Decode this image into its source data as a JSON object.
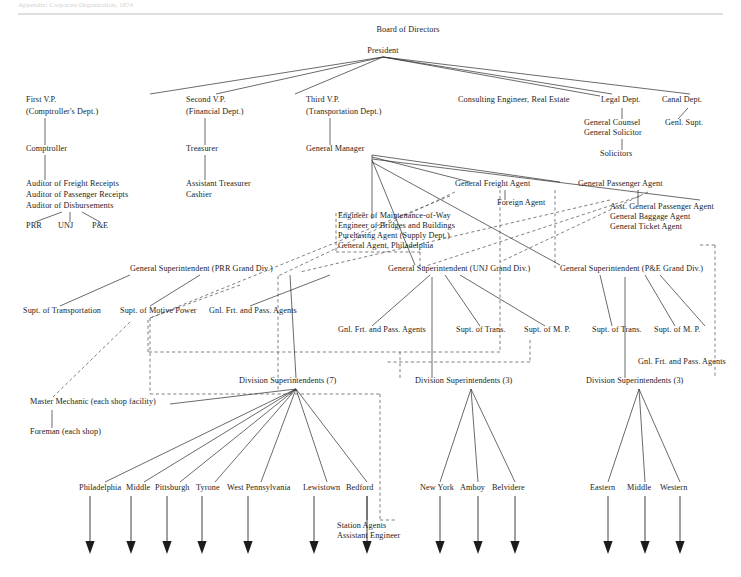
{
  "page": {
    "header_ghost": "Appendix: Corporate Organization, 1874",
    "background": "#ffffff",
    "ink": "#1c1c1c",
    "rule_color": "#b9b9b9"
  },
  "chart_data": {
    "type": "diagram",
    "subtype": "organization-tree",
    "legend": {
      "solid": "direct line of authority",
      "dashed": "staff / functional relationship"
    },
    "nodes": [
      {
        "id": "board",
        "label": "Board of Directors",
        "x": 408,
        "y": 32,
        "anchor": "middle",
        "size": "md"
      },
      {
        "id": "president",
        "label": "President",
        "x": 383,
        "y": 53,
        "anchor": "middle",
        "size": "md"
      },
      {
        "id": "vp1",
        "label": "First V.P.",
        "x": 26,
        "y": 102,
        "anchor": "start",
        "size": "md"
      },
      {
        "id": "vp1sub",
        "label": "(Comptroller's Dept.)",
        "x": 26,
        "y": 114,
        "anchor": "start",
        "size": "md"
      },
      {
        "id": "vp2",
        "label": "Second V.P.",
        "x": 186,
        "y": 102,
        "anchor": "start",
        "size": "md"
      },
      {
        "id": "vp2sub",
        "label": "(Financial Dept.)",
        "x": 186,
        "y": 114,
        "anchor": "start",
        "size": "md"
      },
      {
        "id": "vp3",
        "label": "Third V.P.",
        "x": 306,
        "y": 102,
        "anchor": "start",
        "size": "md"
      },
      {
        "id": "vp3sub",
        "label": "(Transportation Dept.)",
        "x": 306,
        "y": 114,
        "anchor": "start",
        "size": "md"
      },
      {
        "id": "consulting",
        "label": "Consulting Engineer, Real Estate",
        "x": 458,
        "y": 102,
        "anchor": "start",
        "size": "md"
      },
      {
        "id": "legal",
        "label": "Legal Dept.",
        "x": 601,
        "y": 102,
        "anchor": "start",
        "size": "md"
      },
      {
        "id": "canal",
        "label": "Canal Dept.",
        "x": 662,
        "y": 102,
        "anchor": "start",
        "size": "md"
      },
      {
        "id": "gencounsel",
        "label": "General  Counsel",
        "x": 584,
        "y": 125,
        "anchor": "start",
        "size": "md"
      },
      {
        "id": "gensolicitor",
        "label": "General  Solicitor",
        "x": 584,
        "y": 135,
        "anchor": "start",
        "size": "md"
      },
      {
        "id": "solicitors",
        "label": "Solicitors",
        "x": 600,
        "y": 156,
        "anchor": "start",
        "size": "md"
      },
      {
        "id": "genlsupt",
        "label": "Genl. Supt.",
        "x": 665,
        "y": 125,
        "anchor": "start",
        "size": "md"
      },
      {
        "id": "comptroller",
        "label": "Comptroller",
        "x": 26,
        "y": 151,
        "anchor": "start",
        "size": "md"
      },
      {
        "id": "treasurer",
        "label": "Treasurer",
        "x": 186,
        "y": 151,
        "anchor": "start",
        "size": "md"
      },
      {
        "id": "genmanager",
        "label": "General Manager",
        "x": 306,
        "y": 151,
        "anchor": "start",
        "size": "md"
      },
      {
        "id": "aud1",
        "label": "Auditor of Freight Receipts",
        "x": 26,
        "y": 186,
        "anchor": "start",
        "size": "md"
      },
      {
        "id": "aud2",
        "label": "Auditor of Passenger Receipts",
        "x": 26,
        "y": 197,
        "anchor": "start",
        "size": "md"
      },
      {
        "id": "aud3",
        "label": "Auditor of Disbursements",
        "x": 26,
        "y": 208,
        "anchor": "start",
        "size": "md"
      },
      {
        "id": "prr",
        "label": "PRR",
        "x": 26,
        "y": 228,
        "anchor": "start",
        "size": "md"
      },
      {
        "id": "unj",
        "label": "UNJ",
        "x": 58,
        "y": 228,
        "anchor": "start",
        "size": "md"
      },
      {
        "id": "pe",
        "label": "P&E",
        "x": 92,
        "y": 228,
        "anchor": "start",
        "size": "md"
      },
      {
        "id": "asstreas",
        "label": "Assistant Treasurer",
        "x": 186,
        "y": 186,
        "anchor": "start",
        "size": "md"
      },
      {
        "id": "cashier",
        "label": "Cashier",
        "x": 186,
        "y": 197,
        "anchor": "start",
        "size": "md"
      },
      {
        "id": "engmw",
        "label": "Engineer of Maintenance-of-Way",
        "x": 338,
        "y": 218,
        "anchor": "start",
        "size": "md"
      },
      {
        "id": "engbb",
        "label": "Engineer of Bridges and Buildings",
        "x": 338,
        "y": 228,
        "anchor": "start",
        "size": "md"
      },
      {
        "id": "purch",
        "label": "Purchasing Agent   (Supply Dept.)",
        "x": 338,
        "y": 238,
        "anchor": "start",
        "size": "md"
      },
      {
        "id": "genagent",
        "label": "General Agent, Philadelphia",
        "x": 338,
        "y": 248,
        "anchor": "start",
        "size": "md"
      },
      {
        "id": "gfa",
        "label": "General Freight Agent",
        "x": 455,
        "y": 186,
        "anchor": "start",
        "size": "md"
      },
      {
        "id": "foreign",
        "label": "Foreign Agent",
        "x": 497,
        "y": 205,
        "anchor": "start",
        "size": "md"
      },
      {
        "id": "gpa",
        "label": "General Passenger Agent",
        "x": 578,
        "y": 186,
        "anchor": "start",
        "size": "md"
      },
      {
        "id": "agpa",
        "label": "Asst. General Passenger Agent",
        "x": 610,
        "y": 209,
        "anchor": "start",
        "size": "md"
      },
      {
        "id": "gba",
        "label": "General Baggage Agent",
        "x": 610,
        "y": 219,
        "anchor": "start",
        "size": "md"
      },
      {
        "id": "gta",
        "label": "General Ticket Agent",
        "x": 610,
        "y": 229,
        "anchor": "start",
        "size": "md"
      },
      {
        "id": "gs-prr",
        "label": "General Superintendent  (PRR Grand Div.)",
        "x": 130,
        "y": 271,
        "anchor": "start",
        "size": "md"
      },
      {
        "id": "gs-unj",
        "label": "General Superintendent (UNJ Grand Div.)",
        "x": 388,
        "y": 271,
        "anchor": "start",
        "size": "md"
      },
      {
        "id": "gs-pe",
        "label": "General Superintendent (P&E Grand Div.)",
        "x": 560,
        "y": 271,
        "anchor": "start",
        "size": "md"
      },
      {
        "id": "supt-trans-prr",
        "label": "Supt. of Transportation",
        "x": 23,
        "y": 313,
        "anchor": "start",
        "size": "md"
      },
      {
        "id": "supt-mp-prr",
        "label": "Supt. of Motive Power",
        "x": 120,
        "y": 313,
        "anchor": "start",
        "size": "md"
      },
      {
        "id": "gfpa-prr",
        "label": "Gnl. Frt. and Pass. Agents",
        "x": 209,
        "y": 313,
        "anchor": "start",
        "size": "md"
      },
      {
        "id": "gfpa-unj",
        "label": "Gnl. Frt. and Pass. Agents",
        "x": 338,
        "y": 332,
        "anchor": "start",
        "size": "md"
      },
      {
        "id": "supt-trans-unj",
        "label": "Supt. of Trans.",
        "x": 456,
        "y": 332,
        "anchor": "start",
        "size": "md"
      },
      {
        "id": "supt-mp-unj",
        "label": "Supt. of M. P.",
        "x": 524,
        "y": 332,
        "anchor": "start",
        "size": "md"
      },
      {
        "id": "supt-trans-pe",
        "label": "Supt. of Trans.",
        "x": 592,
        "y": 332,
        "anchor": "start",
        "size": "md"
      },
      {
        "id": "supt-mp-pe",
        "label": "Supt. of M. P.",
        "x": 654,
        "y": 332,
        "anchor": "start",
        "size": "md"
      },
      {
        "id": "gfpa-pe",
        "label": "Gnl. Frt. and Pass. Agents",
        "x": 638,
        "y": 364,
        "anchor": "start",
        "size": "md"
      },
      {
        "id": "mm",
        "label": "Master Mechanic (each shop facility)",
        "x": 30,
        "y": 404,
        "anchor": "start",
        "size": "md"
      },
      {
        "id": "foreman",
        "label": "Foreman (each shop)",
        "x": 30,
        "y": 434,
        "anchor": "start",
        "size": "md"
      },
      {
        "id": "ds7",
        "label": "Division Superintendents (7)",
        "x": 239,
        "y": 383,
        "anchor": "start",
        "size": "md"
      },
      {
        "id": "ds3a",
        "label": "Division Superintendents (3)",
        "x": 415,
        "y": 383,
        "anchor": "start",
        "size": "md"
      },
      {
        "id": "ds3b",
        "label": "Division Superintendents (3)",
        "x": 586,
        "y": 383,
        "anchor": "start",
        "size": "md"
      },
      {
        "id": "station",
        "label": "Station Agents",
        "x": 337,
        "y": 528,
        "anchor": "start",
        "size": "md"
      },
      {
        "id": "asstengineer",
        "label": "Assistant Engineer",
        "x": 337,
        "y": 538,
        "anchor": "start",
        "size": "md"
      }
    ],
    "divisions": {
      "prr": {
        "parent": "ds7",
        "parent_point": [
          296,
          389
        ],
        "items": [
          {
            "label": "Philadelphia",
            "x": 79,
            "y": 490,
            "tick_x": 105,
            "arrow_x": 90
          },
          {
            "label": "Middle",
            "x": 126,
            "y": 490,
            "tick_x": 144,
            "arrow_x": 131
          },
          {
            "label": "Pittsburgh",
            "x": 155,
            "y": 490,
            "tick_x": 180,
            "arrow_x": 167
          },
          {
            "label": "Tyrone",
            "x": 196,
            "y": 490,
            "tick_x": 215,
            "arrow_x": 202
          },
          {
            "label": "West Pennsylvania",
            "x": 227,
            "y": 490,
            "tick_x": 261,
            "arrow_x": 248
          },
          {
            "label": "Lewistown",
            "x": 303,
            "y": 490,
            "tick_x": 327,
            "arrow_x": 314
          },
          {
            "label": "Bedford",
            "x": 346,
            "y": 490,
            "tick_x": 367,
            "arrow_x": 367
          }
        ]
      },
      "unj": {
        "parent": "ds3a",
        "parent_point": [
          471,
          389
        ],
        "items": [
          {
            "label": "New York",
            "x": 420,
            "y": 490,
            "tick_x": 440,
            "arrow_x": 440
          },
          {
            "label": "Amboy",
            "x": 460,
            "y": 490,
            "tick_x": 478,
            "arrow_x": 478
          },
          {
            "label": "Belvidere",
            "x": 492,
            "y": 490,
            "tick_x": 515,
            "arrow_x": 515
          }
        ]
      },
      "pe": {
        "parent": "ds3b",
        "parent_point": [
          639,
          389
        ],
        "items": [
          {
            "label": "Eastern",
            "x": 590,
            "y": 490,
            "tick_x": 608,
            "arrow_x": 608
          },
          {
            "label": "Middle",
            "x": 627,
            "y": 490,
            "tick_x": 645,
            "arrow_x": 645
          },
          {
            "label": "Western",
            "x": 660,
            "y": 490,
            "tick_x": 680,
            "arrow_x": 680
          }
        ]
      }
    },
    "edges_solid": [
      [
        383,
        57,
        150,
        94
      ],
      [
        383,
        57,
        216,
        94
      ],
      [
        383,
        57,
        295,
        94
      ],
      [
        383,
        57,
        612,
        94
      ],
      [
        383,
        57,
        690,
        94
      ],
      [
        383,
        57,
        600,
        96
      ],
      [
        45,
        118,
        45,
        145
      ],
      [
        205,
        118,
        205,
        145
      ],
      [
        330,
        118,
        330,
        145
      ],
      [
        45,
        155,
        45,
        180
      ],
      [
        205,
        155,
        205,
        180
      ],
      [
        62,
        212,
        35,
        222
      ],
      [
        70,
        212,
        70,
        222
      ],
      [
        82,
        212,
        100,
        222
      ],
      [
        622,
        108,
        622,
        119
      ],
      [
        622,
        139,
        622,
        150
      ],
      [
        688,
        108,
        678,
        119
      ],
      [
        372,
        155,
        372,
        219
      ],
      [
        372,
        155,
        560,
        182
      ],
      [
        372,
        157,
        470,
        182
      ],
      [
        372,
        159,
        700,
        200
      ],
      [
        372,
        160,
        415,
        265
      ],
      [
        372,
        162,
        560,
        265
      ],
      [
        505,
        190,
        505,
        200
      ],
      [
        638,
        190,
        638,
        205
      ],
      [
        130,
        275,
        60,
        306
      ],
      [
        200,
        275,
        150,
        306
      ],
      [
        330,
        275,
        250,
        306
      ],
      [
        290,
        275,
        296,
        378
      ],
      [
        430,
        275,
        372,
        326
      ],
      [
        445,
        275,
        480,
        326
      ],
      [
        460,
        275,
        545,
        326
      ],
      [
        432,
        277,
        432,
        378
      ],
      [
        600,
        275,
        612,
        326
      ],
      [
        625,
        277,
        625,
        378
      ],
      [
        645,
        275,
        675,
        326
      ],
      [
        660,
        275,
        705,
        326
      ],
      [
        296,
        389,
        105,
        482
      ],
      [
        296,
        389,
        144,
        482
      ],
      [
        296,
        389,
        180,
        482
      ],
      [
        296,
        389,
        215,
        482
      ],
      [
        296,
        389,
        261,
        482
      ],
      [
        296,
        389,
        327,
        482
      ],
      [
        296,
        389,
        367,
        482
      ],
      [
        296,
        389,
        170,
        404
      ],
      [
        471,
        389,
        440,
        482
      ],
      [
        471,
        389,
        478,
        482
      ],
      [
        471,
        389,
        515,
        482
      ],
      [
        639,
        389,
        608,
        482
      ],
      [
        639,
        389,
        645,
        482
      ],
      [
        639,
        389,
        680,
        482
      ],
      [
        52,
        410,
        52,
        428
      ],
      [
        367,
        496,
        367,
        520
      ]
    ],
    "edges_dashed": [
      [
        365,
        213,
        336,
        213
      ],
      [
        336,
        213,
        336,
        252
      ],
      [
        336,
        252,
        420,
        252
      ],
      [
        420,
        252,
        420,
        268
      ],
      [
        500,
        190,
        500,
        352
      ],
      [
        500,
        352,
        148,
        352
      ],
      [
        148,
        352,
        148,
        318
      ],
      [
        555,
        190,
        555,
        268
      ],
      [
        648,
        192,
        500,
        262
      ],
      [
        640,
        196,
        420,
        268
      ],
      [
        610,
        200,
        300,
        272
      ],
      [
        455,
        192,
        278,
        276
      ],
      [
        450,
        196,
        150,
        318
      ],
      [
        700,
        245,
        715,
        245
      ],
      [
        715,
        245,
        715,
        378
      ],
      [
        400,
        378,
        400,
        352
      ],
      [
        530,
        340,
        530,
        362
      ],
      [
        530,
        362,
        385,
        362
      ],
      [
        240,
        285,
        150,
        318
      ],
      [
        150,
        318,
        150,
        394
      ],
      [
        150,
        394,
        380,
        394
      ],
      [
        380,
        394,
        380,
        520
      ],
      [
        380,
        520,
        395,
        520
      ],
      [
        278,
        276,
        278,
        390
      ],
      [
        130,
        322,
        52,
        398
      ]
    ]
  }
}
